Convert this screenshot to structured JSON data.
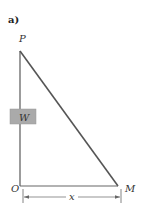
{
  "figure": {
    "panel_label": "a)",
    "points": {
      "P": "P",
      "O": "O",
      "M": "M"
    },
    "weight_label": "W",
    "dimension_label": "x",
    "colors": {
      "line": "#555555",
      "weight_box": "#aaaaaa",
      "text": "#333333"
    }
  }
}
